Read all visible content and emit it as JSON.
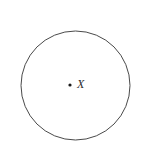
{
  "figure": {
    "type": "geometry-diagram",
    "background_color": "#ffffff",
    "stroke_color": "#4a4a4a",
    "stroke_width": 1,
    "point_color": "#1a1a1a",
    "label_color": "#2b2b2b",
    "circle": {
      "center_x": 75.5,
      "center_y": 85.5,
      "radius": 54.5
    },
    "center_point": {
      "x": 70,
      "y": 85,
      "size": 3,
      "shape": "filled-dot"
    },
    "center_label": {
      "text": "X",
      "x": 81,
      "y": 85,
      "style": "italic"
    }
  }
}
